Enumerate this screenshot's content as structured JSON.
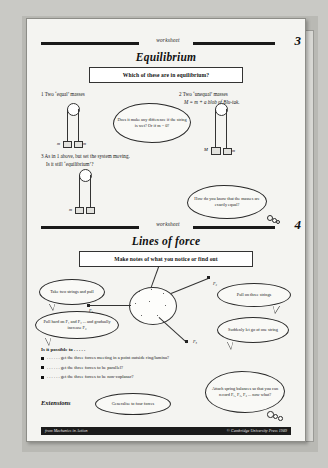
{
  "document": {
    "type": "worksheet-scan",
    "footer": {
      "left": "from Mechanics in Action",
      "right": "© Cambridge University Press 1989"
    }
  },
  "worksheet3": {
    "label": "worksheet",
    "number": "3",
    "title": "Equilibrium",
    "task": "Which of these are in equilibrium?",
    "items": [
      {
        "num": "1",
        "text": "Two ‘equal’ masses"
      },
      {
        "num": "2",
        "text": "Two ‘unequal’ masses",
        "text2": "M = m + a blob of Blu-tak."
      },
      {
        "num": "3",
        "text": "As in 1 above, but set the system moving.",
        "text2": "Is it still ‘equilibrium’?"
      }
    ],
    "labels": {
      "m_left": "m",
      "m_right": "m",
      "M": "M",
      "m2": "m"
    },
    "bubbles": [
      {
        "name": "string-wet-question",
        "text": "Does it make any difference if the string is wet? Or if m = 0?"
      },
      {
        "name": "masses-equal-question",
        "text": "How do you know that the masses are exactly equal?"
      }
    ]
  },
  "worksheet4": {
    "label": "worksheet",
    "number": "4",
    "title": "Lines of force",
    "task": "Make notes of what you notice or find out",
    "bubbles": [
      {
        "name": "two-strings",
        "text": "Take two strings and pull"
      },
      {
        "name": "pull-hard",
        "text": "Pull hard on F₁ and F₂ ... and gradually increase F₃"
      },
      {
        "name": "three-strings",
        "text": "Pull on three strings"
      },
      {
        "name": "let-go",
        "text": "Suddenly let go of one string"
      },
      {
        "name": "spring-balances",
        "text": "Attach spring balances so that you can record F₁, F₂, F₃ ... now what?"
      },
      {
        "name": "generalise",
        "text": "Generalise to four forces"
      }
    ],
    "diagram_labels": [
      "F₁",
      "F₂",
      "F₃"
    ],
    "prompt": "Is it possible to . . . . .",
    "bullets": [
      ". . . . . . get the three forces meeting in a point outside ring/lamina?",
      ". . . . . . get the three forces to be parallel?",
      ". . . . . . get the three forces to be non-coplanar?"
    ],
    "extensions_label": "Extensions"
  }
}
